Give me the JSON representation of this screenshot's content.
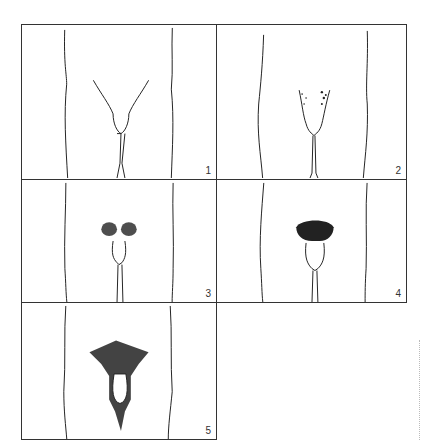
{
  "figure": {
    "panels": [
      {
        "label": "1",
        "stage": 1
      },
      {
        "label": "2",
        "stage": 2
      },
      {
        "label": "3",
        "stage": 3
      },
      {
        "label": "4",
        "stage": 4
      },
      {
        "label": "5",
        "stage": 5
      }
    ]
  }
}
